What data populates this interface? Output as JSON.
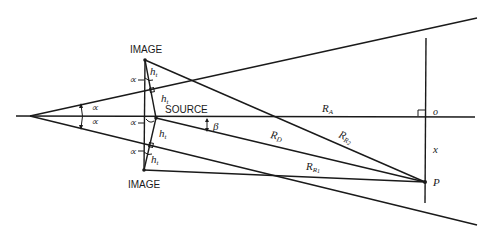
{
  "diagram": {
    "type": "geometric ray diagram (image sources in a wedge)",
    "labels": {
      "image_top": "IMAGE",
      "image_bottom": "IMAGE",
      "source": "SOURCE",
      "point_p": "P",
      "origin": "o",
      "x_dist": "x",
      "beta": "β",
      "alpha": "∝",
      "h_t": "h",
      "h_t_sub": "t",
      "r_a": "R",
      "r_a_sub": "A",
      "r_d": "R",
      "r_d_sub": "D",
      "r_r1": "R",
      "r_r1_sub": "R",
      "r_r1_subsub": "1",
      "r_r2": "R",
      "r_r2_sub": "R",
      "r_r2_subsub": "2"
    },
    "colors": {
      "ink": "#1a1a1a",
      "background": "#ffffff"
    }
  }
}
